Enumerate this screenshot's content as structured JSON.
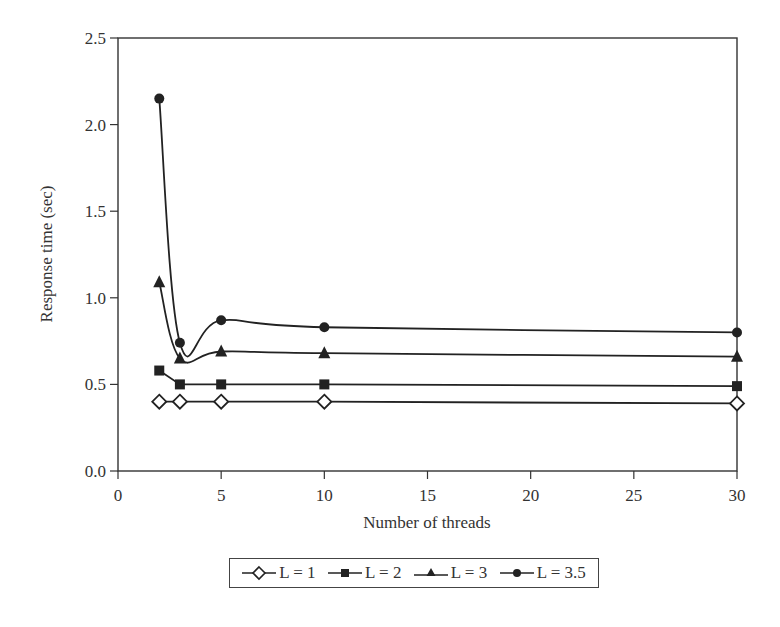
{
  "chart_data": {
    "type": "line",
    "title": "",
    "xlabel": "Number of threads",
    "ylabel": "Response time (sec)",
    "xlim": [
      0,
      30
    ],
    "ylim": [
      0.0,
      2.5
    ],
    "x_ticks": [
      "0",
      "5",
      "10",
      "15",
      "20",
      "25",
      "30"
    ],
    "y_ticks": [
      "0.0",
      "0.5",
      "1.0",
      "1.5",
      "2.0",
      "2.5"
    ],
    "grid": false,
    "legend_position": "bottom-center",
    "x": [
      2,
      3,
      5,
      10,
      30
    ],
    "series": [
      {
        "name": "L = 1",
        "marker": "diamond-open",
        "values": [
          0.4,
          0.4,
          0.4,
          0.4,
          0.39
        ]
      },
      {
        "name": "L = 2",
        "marker": "square",
        "values": [
          0.58,
          0.5,
          0.5,
          0.5,
          0.49
        ]
      },
      {
        "name": "L = 3",
        "marker": "triangle",
        "values": [
          1.09,
          0.65,
          0.69,
          0.68,
          0.66
        ]
      },
      {
        "name": "L = 3.5",
        "marker": "circle",
        "values": [
          2.15,
          0.74,
          0.87,
          0.83,
          0.8
        ]
      }
    ]
  },
  "legend": {
    "items": [
      {
        "label": "L = 1"
      },
      {
        "label": "L = 2"
      },
      {
        "label": "L = 3"
      },
      {
        "label": "L = 3.5"
      }
    ]
  }
}
